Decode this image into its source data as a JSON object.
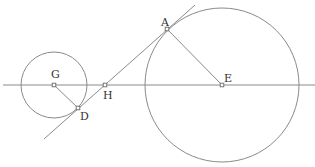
{
  "diagram": {
    "title": "",
    "colors": {
      "line": "#8a8a8a",
      "text": "#333333",
      "background": "#ffffff"
    },
    "points": [
      {
        "id": "G",
        "label": "G",
        "x": 54,
        "y": 85,
        "lx": 51,
        "ly": 78
      },
      {
        "id": "D",
        "label": "D",
        "x": 78,
        "y": 108,
        "lx": 80,
        "ly": 120
      },
      {
        "id": "H",
        "label": "H",
        "x": 105,
        "y": 85,
        "lx": 103,
        "ly": 99
      },
      {
        "id": "A",
        "label": "A",
        "x": 167,
        "y": 29,
        "lx": 161,
        "ly": 26
      },
      {
        "id": "E",
        "label": "E",
        "x": 222,
        "y": 85,
        "lx": 224,
        "ly": 82
      }
    ],
    "circles": [
      {
        "name": "small-circle",
        "center": "G",
        "cx": 54,
        "cy": 85,
        "r": 33
      },
      {
        "name": "large-circle",
        "center": "E",
        "cx": 222,
        "cy": 85,
        "r": 77
      }
    ],
    "lines": [
      {
        "name": "horizontal-axis-line",
        "x1": 3,
        "y1": 85,
        "x2": 315,
        "y2": 85
      },
      {
        "name": "common-tangent-line",
        "x1": 44,
        "y1": 139,
        "x2": 195,
        "y2": 5
      },
      {
        "name": "radius-GD",
        "x1": 54,
        "y1": 85,
        "x2": 78,
        "y2": 108
      },
      {
        "name": "radius-EA",
        "x1": 222,
        "y1": 85,
        "x2": 167,
        "y2": 29
      }
    ]
  }
}
